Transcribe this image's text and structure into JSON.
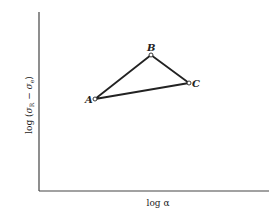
{
  "figure": {
    "x_axis_label": "log α",
    "y_axis_label": "log (σ_R − σ_e)",
    "y_axis_label_main": "log (",
    "y_axis_sigma1": "σ",
    "y_axis_sub1": "R",
    "y_axis_minus": " − ",
    "y_axis_sigma2": "σ",
    "y_axis_sub2": "e",
    "y_axis_close": ")",
    "points": [
      {
        "name": "A",
        "x": 95,
        "y": 99
      },
      {
        "name": "B",
        "x": 151,
        "y": 55
      },
      {
        "name": "C",
        "x": 189,
        "y": 83
      }
    ],
    "colors": {
      "line": "#222222",
      "axis": "#444444",
      "marker_fill": "#ffffff"
    }
  }
}
